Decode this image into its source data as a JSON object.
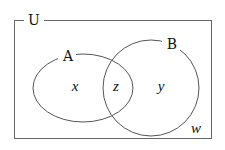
{
  "diagram": {
    "type": "venn",
    "universe_label": "U",
    "sets": [
      {
        "id": "A",
        "label": "A"
      },
      {
        "id": "B",
        "label": "B"
      }
    ],
    "regions": {
      "only_a": "x",
      "intersection": "z",
      "only_b": "y",
      "outside": "w"
    },
    "colors": {
      "stroke": "#555555",
      "text": "#111111",
      "background": "#ffffff"
    }
  }
}
